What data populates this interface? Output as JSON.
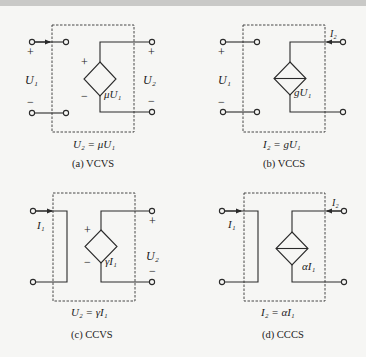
{
  "panels": [
    {
      "id": "a",
      "caption": "(a) VCVS",
      "caption_label": "(a)",
      "caption_type": "VCVS",
      "relation": "U₂ = μU₁",
      "input_label": "U₁",
      "output_label": "U₂",
      "source_label": "μU₁",
      "source_kind": "voltage-source",
      "input_plus": "+",
      "input_minus": "−",
      "output_plus": "+",
      "output_minus": "−",
      "source_plus": "+",
      "source_minus": "−"
    },
    {
      "id": "b",
      "caption": "(b) VCCS",
      "caption_label": "(b)",
      "caption_type": "VCCS",
      "relation": "I₂ = gU₁",
      "input_label": "U₁",
      "output_current": "I₂",
      "source_label": "gU₁",
      "source_kind": "current-source",
      "input_plus": "+",
      "input_minus": "−"
    },
    {
      "id": "c",
      "caption": "(c) CCVS",
      "caption_label": "(c)",
      "caption_type": "CCVS",
      "relation": "U₂ = γI₁",
      "input_current": "I₁",
      "output_label": "U₂",
      "source_label": "γI₁",
      "source_kind": "voltage-source",
      "output_plus": "+",
      "output_minus": "−",
      "source_plus": "+",
      "source_minus": "−"
    },
    {
      "id": "d",
      "caption": "(d) CCCS",
      "caption_label": "(d)",
      "caption_type": "CCCS",
      "relation": "I₂ = αI₁",
      "input_current": "I₁",
      "output_current": "I₂",
      "source_label": "αI₁",
      "source_kind": "current-source"
    }
  ]
}
